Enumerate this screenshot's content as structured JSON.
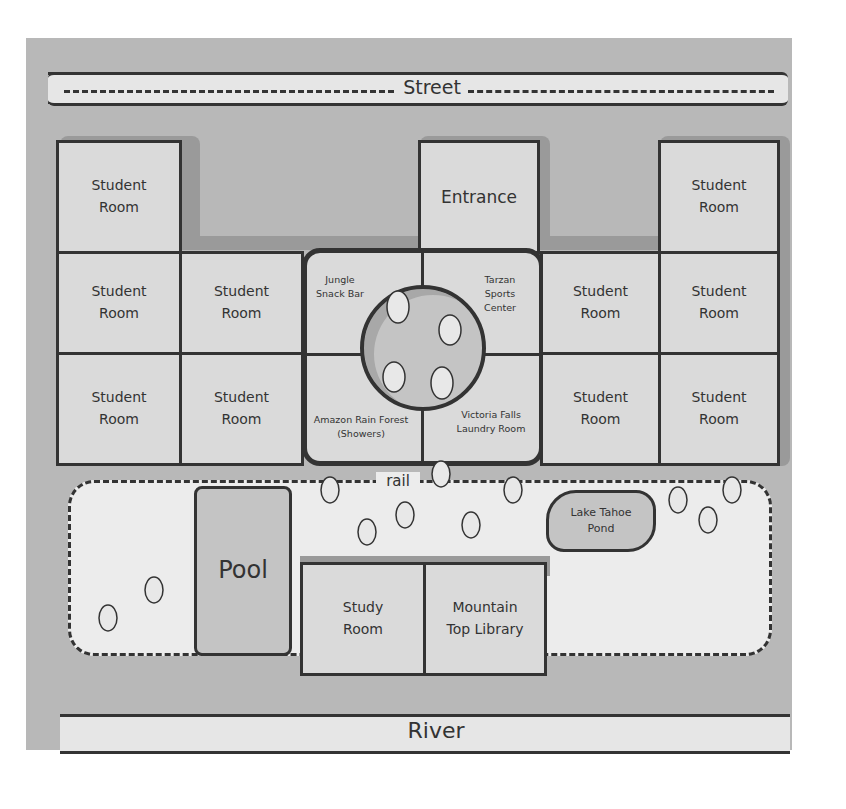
{
  "map": {
    "street": {
      "label": "Street"
    },
    "river": {
      "label": "River"
    },
    "trail": {
      "label": "rail"
    },
    "buildings": {
      "left_wing": [
        {
          "label": "Student Room"
        },
        {
          "label": "Student Room"
        },
        {
          "label": "Student Room"
        },
        {
          "label": "Student Room"
        },
        {
          "label": "Student Room"
        }
      ],
      "entrance": {
        "label": "Entrance"
      },
      "center": [
        {
          "label": "Jungle Snack Bar"
        },
        {
          "label": "Tarzan Sports Center"
        },
        {
          "label": "Amazon Rain Forest (Showers)"
        },
        {
          "label": "Victoria Falls Laundry Room"
        }
      ],
      "right_wing": [
        {
          "label": "Student Room"
        },
        {
          "label": "Student Room"
        },
        {
          "label": "Student Room"
        },
        {
          "label": "Student Room"
        },
        {
          "label": "Student Room"
        }
      ]
    },
    "yard": {
      "pool": {
        "label": "Pool"
      },
      "pond": {
        "label": "Lake Tahoe Pond"
      },
      "study_room": {
        "label": "Study Room"
      },
      "library": {
        "label": "Mountain Top Library"
      }
    },
    "colors": {
      "background": "#b8b8b8",
      "room_fill": "#dadada",
      "yard_fill": "#ececec",
      "water_fill": "#c4c4c4",
      "outline": "#333333",
      "shadow": "#9a9a9a"
    }
  }
}
